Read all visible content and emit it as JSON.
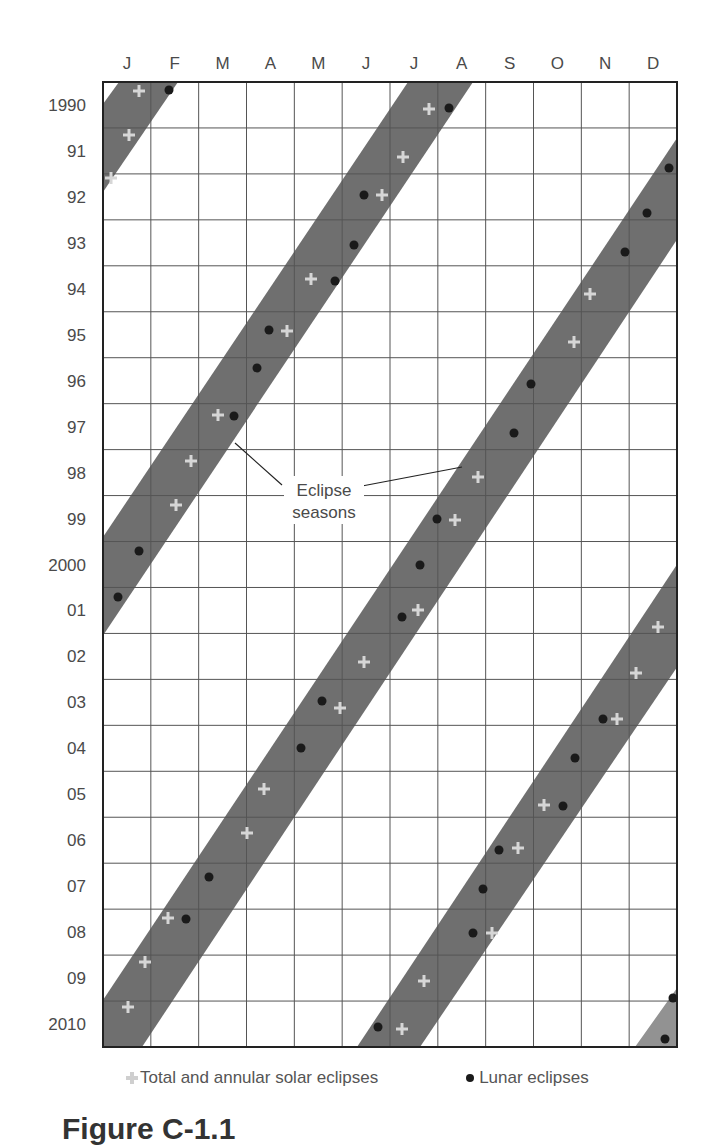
{
  "chart_data": {
    "type": "scatter",
    "title": "",
    "xlabel": "Month",
    "ylabel": "Year",
    "categories_x": [
      "J",
      "F",
      "M",
      "A",
      "M",
      "J",
      "J",
      "A",
      "S",
      "O",
      "N",
      "D"
    ],
    "categories_y": [
      "1990",
      "91",
      "92",
      "93",
      "94",
      "95",
      "96",
      "97",
      "98",
      "99",
      "2000",
      "01",
      "02",
      "03",
      "04",
      "05",
      "06",
      "07",
      "08",
      "09",
      "2010"
    ],
    "grid": true,
    "annotation": {
      "line1": "Eclipse",
      "line2": "seasons"
    },
    "legend": {
      "solar": "Total and annular solar eclipses",
      "lunar": "Lunar eclipses"
    },
    "colors": {
      "band": "#6f6f6f",
      "band_light": "#929292",
      "solar": "#d6d6d6",
      "lunar": "#1a1a1a",
      "grid": "#555555"
    },
    "series": [
      {
        "name": "Total and annular solar eclipses",
        "marker": "plus",
        "points": [
          {
            "year": 1990,
            "month": 1.8
          },
          {
            "year": 1990,
            "month": 7.8
          },
          {
            "year": 1991,
            "month": 1.5
          },
          {
            "year": 1991,
            "month": 7.3
          },
          {
            "year": 1992,
            "month": 1.1
          },
          {
            "year": 1992,
            "month": 6.8
          },
          {
            "year": 1994,
            "month": 5.3
          },
          {
            "year": 1994,
            "month": 11.2
          },
          {
            "year": 1995,
            "month": 4.9
          },
          {
            "year": 1995,
            "month": 10.9
          },
          {
            "year": 1997,
            "month": 3.3
          },
          {
            "year": 1998,
            "month": 2.9
          },
          {
            "year": 1998,
            "month": 8.8
          },
          {
            "year": 1999,
            "month": 2.6
          },
          {
            "year": 1999,
            "month": 8.4
          },
          {
            "year": 2001,
            "month": 6.7
          },
          {
            "year": 2001,
            "month": 12.5
          },
          {
            "year": 2002,
            "month": 6.2
          },
          {
            "year": 2002,
            "month": 12.1
          },
          {
            "year": 2003,
            "month": 5.7
          },
          {
            "year": 2003,
            "month": 11.7
          },
          {
            "year": 2005,
            "month": 4.3
          },
          {
            "year": 2005,
            "month": 10.2
          },
          {
            "year": 2006,
            "month": 3.9
          },
          {
            "year": 2006,
            "month": 9.7
          },
          {
            "year": 2008,
            "month": 2.4
          },
          {
            "year": 2008,
            "month": 8.3
          },
          {
            "year": 2009,
            "month": 1.9
          },
          {
            "year": 2009,
            "month": 7.7
          },
          {
            "year": 2010,
            "month": 1.5
          },
          {
            "year": 2010,
            "month": 7.3
          }
        ]
      },
      {
        "name": "Lunar eclipses",
        "marker": "dot",
        "points": [
          {
            "year": 1990,
            "month": 2.2
          },
          {
            "year": 1990,
            "month": 8.2
          },
          {
            "year": 1992,
            "month": 6.4
          },
          {
            "year": 1992,
            "month": 12.9
          },
          {
            "year": 1993,
            "month": 6.0
          },
          {
            "year": 1993,
            "month": 12.4
          },
          {
            "year": 1994,
            "month": 5.6
          },
          {
            "year": 1994,
            "month": 11.8
          },
          {
            "year": 1995,
            "month": 4.4
          },
          {
            "year": 1996,
            "month": 4.0
          },
          {
            "year": 1996,
            "month": 9.9
          },
          {
            "year": 1997,
            "month": 3.7
          },
          {
            "year": 1997,
            "month": 9.5
          },
          {
            "year": 1999,
            "month": 8.0
          },
          {
            "year": 2000,
            "month": 1.5
          },
          {
            "year": 2000,
            "month": 7.6
          },
          {
            "year": 2001,
            "month": 1.1
          },
          {
            "year": 2001,
            "month": 7.2
          },
          {
            "year": 2003,
            "month": 5.3
          },
          {
            "year": 2003,
            "month": 11.4
          },
          {
            "year": 2004,
            "month": 4.9
          },
          {
            "year": 2004,
            "month": 10.6
          },
          {
            "year": 2005,
            "month": 10.6
          },
          {
            "year": 2006,
            "month": 9.3
          },
          {
            "year": 2007,
            "month": 3.2
          },
          {
            "year": 2007,
            "month": 8.9
          },
          {
            "year": 2008,
            "month": 2.7
          },
          {
            "year": 2008,
            "month": 8.7
          },
          {
            "year": 2009,
            "month": 12.9
          },
          {
            "year": 2010,
            "month": 6.8
          },
          {
            "year": 2010,
            "month": 12.7
          }
        ]
      }
    ]
  },
  "axes": {
    "months": [
      "J",
      "F",
      "M",
      "A",
      "M",
      "J",
      "J",
      "A",
      "S",
      "O",
      "N",
      "D"
    ],
    "years": [
      "1990",
      "91",
      "92",
      "93",
      "94",
      "95",
      "96",
      "97",
      "98",
      "99",
      "2000",
      "01",
      "02",
      "03",
      "04",
      "05",
      "06",
      "07",
      "08",
      "09",
      "2010"
    ]
  },
  "annotation": {
    "line1": "Eclipse",
    "line2": "seasons"
  },
  "legend": {
    "solar_label": "Total and annular solar eclipses",
    "lunar_label": "Lunar eclipses"
  },
  "caption": {
    "text": "Figure C-1.1"
  },
  "markers": {
    "solar": [
      [
        139,
        91
      ],
      [
        129,
        135
      ],
      [
        111,
        178
      ],
      [
        429,
        109
      ],
      [
        403,
        157
      ],
      [
        382,
        195
      ],
      [
        311,
        279
      ],
      [
        287,
        331
      ],
      [
        218,
        415
      ],
      [
        191,
        461
      ],
      [
        176,
        505
      ],
      [
        590,
        294
      ],
      [
        574,
        342
      ],
      [
        478,
        477
      ],
      [
        455,
        520
      ],
      [
        418,
        610
      ],
      [
        364,
        662
      ],
      [
        340,
        708
      ],
      [
        264,
        789
      ],
      [
        247,
        833
      ],
      [
        168,
        918
      ],
      [
        145,
        962
      ],
      [
        128,
        1007
      ],
      [
        658,
        627
      ],
      [
        636,
        673
      ],
      [
        617,
        719
      ],
      [
        544,
        805
      ],
      [
        518,
        848
      ],
      [
        492,
        933
      ],
      [
        424,
        981
      ],
      [
        402,
        1029
      ]
    ],
    "lunar": [
      [
        169,
        90
      ],
      [
        449,
        108
      ],
      [
        364,
        195
      ],
      [
        354,
        245
      ],
      [
        335,
        281
      ],
      [
        269,
        330
      ],
      [
        257,
        368
      ],
      [
        234,
        416
      ],
      [
        139,
        551
      ],
      [
        118,
        597
      ],
      [
        669,
        168
      ],
      [
        647,
        213
      ],
      [
        625,
        252
      ],
      [
        531,
        384
      ],
      [
        514,
        433
      ],
      [
        437,
        519
      ],
      [
        420,
        565
      ],
      [
        402,
        617
      ],
      [
        322,
        701
      ],
      [
        301,
        748
      ],
      [
        209,
        877
      ],
      [
        186,
        919
      ],
      [
        603,
        719
      ],
      [
        575,
        758
      ],
      [
        563,
        806
      ],
      [
        499,
        850
      ],
      [
        483,
        889
      ],
      [
        473,
        933
      ],
      [
        378,
        1027
      ],
      [
        673,
        998
      ],
      [
        665,
        1039
      ]
    ]
  }
}
